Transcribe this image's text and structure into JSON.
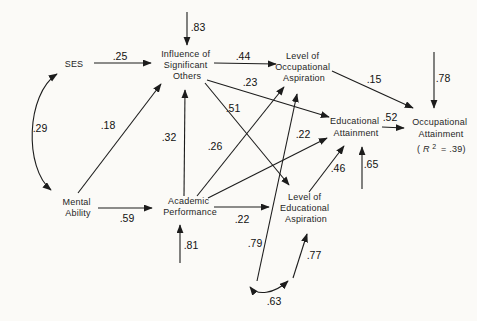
{
  "figure_type": "path-analysis-diagram",
  "colors": {
    "background": "#fbfaf7",
    "ink": "#1c1c1c"
  },
  "nodes": [
    {
      "id": "ses",
      "lines": [
        "SES"
      ]
    },
    {
      "id": "mental-ability",
      "lines": [
        "Mental",
        "Ability"
      ]
    },
    {
      "id": "influence-of-significant-others",
      "lines": [
        "Influence of",
        "Significant",
        "Others"
      ]
    },
    {
      "id": "academic-performance",
      "lines": [
        "Academic",
        "Performance"
      ]
    },
    {
      "id": "level-of-occupational-aspiration",
      "lines": [
        "Level of",
        "Occupational",
        "Aspiration"
      ]
    },
    {
      "id": "level-of-educational-aspiration",
      "lines": [
        "Level of",
        "Educational",
        "Aspiration"
      ]
    },
    {
      "id": "educational-attainment",
      "lines": [
        "Educational",
        "Attainment"
      ]
    },
    {
      "id": "occupational-attainment",
      "lines": [
        "Occupational",
        "Attainment"
      ],
      "r2": {
        "open": "(",
        "symbol": "R",
        "exponent": "2",
        "rest": "= .39)"
      }
    }
  ],
  "paths": [
    {
      "from": "SES",
      "to": "Influence of Significant Others",
      "kind": "causal",
      "coef": ".25"
    },
    {
      "from": "disturbance",
      "to": "Influence of Significant Others",
      "kind": "disturbance",
      "coef": ".83"
    },
    {
      "from": "Mental Ability",
      "to": "Influence of Significant Others",
      "kind": "causal",
      "coef": ".18"
    },
    {
      "from": "Academic Performance",
      "to": "Influence of Significant Others",
      "kind": "causal",
      "coef": ".32"
    },
    {
      "from": "Mental Ability",
      "to": "Academic Performance",
      "kind": "causal",
      "coef": ".59"
    },
    {
      "from": "disturbance",
      "to": "Academic Performance",
      "kind": "disturbance",
      "coef": ".81"
    },
    {
      "from": "Influence of Significant Others",
      "to": "Level of Occupational Aspiration",
      "kind": "causal",
      "coef": ".44"
    },
    {
      "from": "Influence of Significant Others",
      "to": "Educational Attainment",
      "kind": "causal",
      "coef": ".23"
    },
    {
      "from": "Influence of Significant Others",
      "to": "Level of Educational Aspiration",
      "kind": "causal",
      "coef": ".51"
    },
    {
      "from": "Academic Performance",
      "to": "Level of Occupational Aspiration",
      "kind": "causal",
      "coef": ".26"
    },
    {
      "from": "Academic Performance",
      "to": "Educational Attainment",
      "kind": "causal",
      "coef": ".22"
    },
    {
      "from": "Academic Performance",
      "to": "Level of Educational Aspiration",
      "kind": "causal",
      "coef": ".22"
    },
    {
      "from": "Level of Educational Aspiration",
      "to": "Educational Attainment",
      "kind": "causal",
      "coef": ".46"
    },
    {
      "from": "disturbance",
      "to": "Educational Attainment",
      "kind": "disturbance",
      "coef": ".65"
    },
    {
      "from": "Educational Attainment",
      "to": "Occupational Attainment",
      "kind": "causal",
      "coef": ".52"
    },
    {
      "from": "Level of Occupational Aspiration",
      "to": "Occupational Attainment",
      "kind": "causal",
      "coef": ".15"
    },
    {
      "from": "disturbance",
      "to": "Occupational Attainment",
      "kind": "disturbance",
      "coef": ".78"
    },
    {
      "from": "disturbance",
      "to": "Level of Occupational Aspiration",
      "kind": "disturbance",
      "coef": ".79"
    },
    {
      "from": "disturbance",
      "to": "Level of Educational Aspiration",
      "kind": "disturbance",
      "coef": ".77"
    },
    {
      "from": "SES",
      "to": "Mental Ability",
      "kind": "correlation",
      "coef": ".29"
    },
    {
      "from": "Level of Occupational Aspiration disturbance",
      "to": "Level of Educational Aspiration disturbance",
      "kind": "correlation",
      "coef": ".63"
    }
  ]
}
